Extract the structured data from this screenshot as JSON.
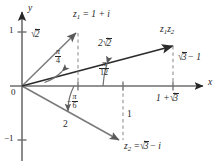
{
  "figure": {
    "type": "complex-plane-vector-diagram",
    "background": "#ffffff",
    "ink": "#262626",
    "axes": {
      "x_label": "x",
      "y_label": "y",
      "origin_label": "0",
      "y_ticks": [
        {
          "label": "1",
          "value": 1
        },
        {
          "label": "-1",
          "value": -1
        }
      ]
    },
    "vectors": [
      {
        "name": "z1",
        "point_label": "z_1 = 1 + i",
        "magnitude_label": "sqrt(2)",
        "angle_label": "pi/4",
        "components": {
          "re": 1,
          "im": 1
        }
      },
      {
        "name": "z2",
        "point_label": "z_2 = sqrt(3) - i",
        "magnitude_label": "2",
        "angle_label": "-pi/6",
        "components": {
          "re": 1.7320508,
          "im": -1
        }
      },
      {
        "name": "z1z2",
        "point_label": "z_1 z_2",
        "magnitude_label": "2 sqrt(2)",
        "angle_label": "pi/12",
        "components": {
          "re": 2.7320508,
          "im": 0.7320508
        }
      }
    ],
    "annotations": {
      "x_intercept_product": "1 + sqrt(3)",
      "y_height_product": "sqrt(3) - 1",
      "z2_drop_length": "1"
    }
  },
  "labels": {
    "y_axis": "y",
    "x_axis": "x",
    "origin": "0",
    "tick_one": "1",
    "tick_neg_one": "−1",
    "z1_point_lead": "z",
    "z1_point_sub": "1",
    "z1_point_rest": "= 1 + i",
    "z1_magnitude_arg": "2",
    "z1_angle_num": "π",
    "z1_angle_den": "4",
    "z2_point_lead": "z",
    "z2_point_sub": "2",
    "z2_point_eq": "=",
    "z2_point_arg": "3",
    "z2_point_tail": "− i",
    "z2_magnitude": "2",
    "z2_angle_sign": "−",
    "z2_angle_num": "π",
    "z2_angle_den": "6",
    "prod_point_lead": "z",
    "prod_point_sub1": "1",
    "prod_point_lead2": "z",
    "prod_point_sub2": "2",
    "prod_magnitude_coef": "2",
    "prod_magnitude_arg": "2",
    "prod_angle_num": "π",
    "prod_angle_den": "12",
    "x_intercept_pre": "1 +",
    "x_intercept_arg": "3",
    "height_arg": "3",
    "height_tail": "− 1",
    "drop_length": "1"
  }
}
